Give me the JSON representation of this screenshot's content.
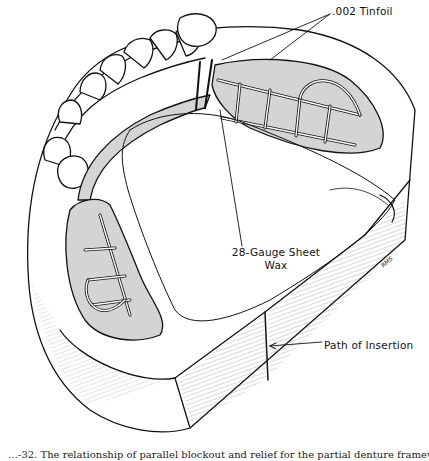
{
  "figure": {
    "labels": {
      "tinfoil": ".002  Tinfoil",
      "sheet_wax_line1": "28-Gauge  Sheet",
      "sheet_wax_line2": "Wax",
      "path_of_insertion": "Path of Insertion"
    },
    "artist_signature": "RMS",
    "colors": {
      "line": "#111111",
      "relief_fill": "#d4d4d4",
      "background": "#ffffff"
    }
  },
  "caption": {
    "text": "…-32. The relationship of parallel blockout and relief for the partial denture framework…",
    "clipped": true
  }
}
